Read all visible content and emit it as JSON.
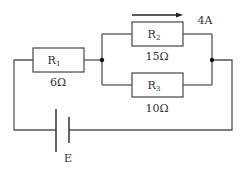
{
  "diagram": {
    "type": "electric-circuit",
    "colors": {
      "line": "#555555",
      "text": "#333333",
      "background": "#ffffff"
    },
    "resistors": [
      {
        "id": "R1",
        "letter": "R",
        "subscript": "1",
        "value": "6Ω"
      },
      {
        "id": "R2",
        "letter": "R",
        "subscript": "2",
        "value": "15Ω"
      },
      {
        "id": "R3",
        "letter": "R",
        "subscript": "3",
        "value": "10Ω"
      }
    ],
    "current": {
      "label": "4A",
      "direction": "right",
      "through": "R2"
    },
    "battery": {
      "label": "E"
    },
    "topology": "R1 in series with parallel combination of R2 and R3, powered by battery E"
  }
}
